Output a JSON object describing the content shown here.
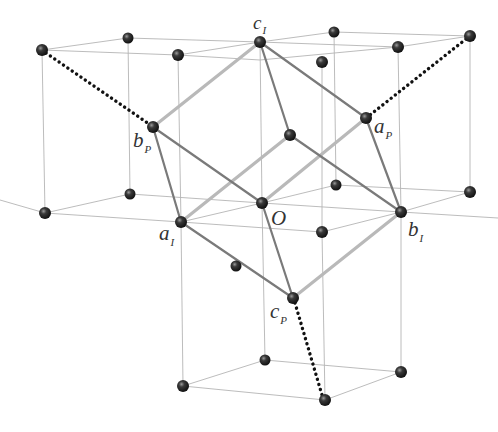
{
  "diagram": {
    "labels": {
      "c_I": {
        "main": "c",
        "sub": "I"
      },
      "b_P": {
        "main": "b",
        "sub": "P"
      },
      "a_P": {
        "main": "a",
        "sub": "P"
      },
      "O": {
        "main": "O",
        "sub": ""
      },
      "a_I": {
        "main": "a",
        "sub": "I"
      },
      "b_I": {
        "main": "b",
        "sub": "I"
      },
      "c_P": {
        "main": "c",
        "sub": "P"
      }
    },
    "colors": {
      "atom": "#2a2a2a",
      "thin_edge": "#b4b4b4",
      "bond_dark": "#7a7a7a",
      "bond_light": "#b9b9b9",
      "dotted": "#111111"
    }
  }
}
